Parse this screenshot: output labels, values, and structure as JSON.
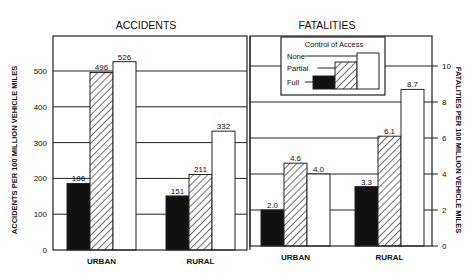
{
  "chart_data": [
    {
      "type": "bar",
      "title": "ACCIDENTS",
      "xlabel": "",
      "ylabel": "ACCIDENTS PER 100 MILLION VEHICLE MILES",
      "ylim": [
        0,
        550
      ],
      "yticks": [
        0,
        100,
        200,
        300,
        400,
        500
      ],
      "grid": true,
      "categories": [
        "URBAN",
        "RURAL"
      ],
      "series": [
        {
          "name": "Full",
          "values": [
            186,
            151
          ]
        },
        {
          "name": "Partial",
          "values": [
            496,
            211
          ]
        },
        {
          "name": "None",
          "values": [
            526,
            332
          ]
        }
      ]
    },
    {
      "type": "bar",
      "title": "FATALITIES",
      "xlabel": "",
      "ylabel": "FATALITIES PER 100 MILLION VEHICLE MILES",
      "ylim": [
        0,
        11
      ],
      "yticks": [
        0,
        2,
        4,
        6,
        8,
        10
      ],
      "grid": true,
      "categories": [
        "URBAN",
        "RURAL"
      ],
      "series": [
        {
          "name": "Full",
          "values": [
            2.0,
            3.3
          ]
        },
        {
          "name": "Partial",
          "values": [
            4.6,
            6.1
          ]
        },
        {
          "name": "None",
          "values": [
            4.0,
            8.7
          ]
        }
      ],
      "value_labels": [
        [
          "2.0",
          "3.3"
        ],
        [
          "4.6",
          "6.1"
        ],
        [
          "4.0",
          "8.7"
        ]
      ]
    }
  ],
  "legend": {
    "title": "Control of Access",
    "position": "inside fatalities panel, top",
    "items": [
      {
        "label": "None",
        "fill": "white"
      },
      {
        "label": "Partial",
        "fill": "hatched"
      },
      {
        "label": "Full",
        "fill": "black"
      }
    ]
  },
  "colors": {
    "full": "#111111",
    "partial": "hatch",
    "none": "#ffffff",
    "line": "#222222"
  }
}
